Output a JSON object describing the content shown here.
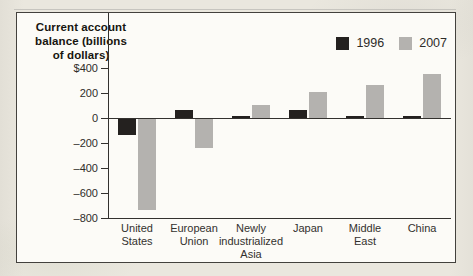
{
  "title_lines": [
    "Current account",
    "balance (billions",
    "of dollars)"
  ],
  "chart_data": {
    "type": "bar",
    "title": "Current account balance (billions of dollars)",
    "xlabel": "",
    "ylabel": "Current account balance (billions of dollars)",
    "categories": [
      "United States",
      "European Union",
      "Newly industrialized Asia",
      "Japan",
      "Middle East",
      "China"
    ],
    "category_lines": [
      [
        "United",
        "States"
      ],
      [
        "European",
        "Union"
      ],
      [
        "Newly",
        "industrialized",
        "Asia"
      ],
      [
        "Japan"
      ],
      [
        "Middle",
        "East"
      ],
      [
        "China"
      ]
    ],
    "series": [
      {
        "name": "1996",
        "color": "#24211f",
        "values": [
          -130,
          60,
          5,
          60,
          15,
          10
        ]
      },
      {
        "name": "2007",
        "color": "#b4b2af",
        "values": [
          -730,
          -230,
          100,
          210,
          265,
          350
        ]
      }
    ],
    "yticks": [
      {
        "label": "$400",
        "value": 400
      },
      {
        "label": "200",
        "value": 200
      },
      {
        "label": "0",
        "value": 0
      },
      {
        "label": "–200",
        "value": -200
      },
      {
        "label": "–400",
        "value": -400
      },
      {
        "label": "–600",
        "value": -600
      },
      {
        "label": "–800",
        "value": -800
      }
    ],
    "ylim": [
      -800,
      400
    ],
    "grid": false,
    "legend_position": "top-right"
  }
}
